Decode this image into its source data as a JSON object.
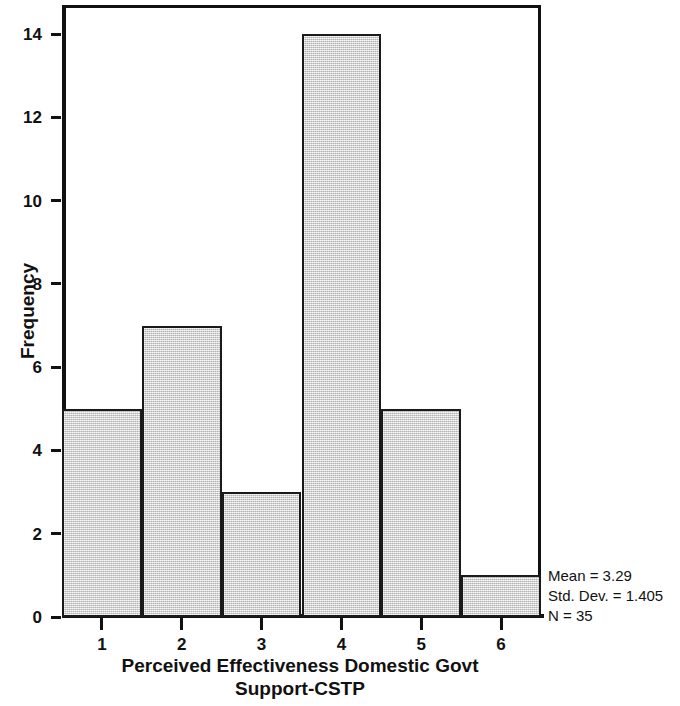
{
  "chart_data": {
    "type": "bar",
    "title": "",
    "xlabel": "Perceived Effectiveness Domestic Govt Support-CSTP",
    "xlabel_line1": "Perceived Effectiveness Domestic Govt",
    "xlabel_line2": "Support-CSTP",
    "ylabel": "Frequency",
    "categories": [
      "1",
      "2",
      "3",
      "4",
      "5",
      "6"
    ],
    "values": [
      5,
      7,
      3,
      14,
      5,
      1
    ],
    "bin_edges": [
      0.5,
      1.5,
      2.5,
      3.5,
      4.5,
      5.5,
      6.5
    ],
    "x_tick_labels": [
      "1",
      "2",
      "3",
      "4",
      "5",
      "6"
    ],
    "y_tick_labels": [
      "0",
      "2",
      "4",
      "6",
      "8",
      "10",
      "12",
      "14"
    ],
    "y_tick_values": [
      0,
      2,
      4,
      6,
      8,
      10,
      12,
      14
    ],
    "ylim": [
      0,
      14.7
    ],
    "xlim": [
      0.5,
      6.5
    ],
    "grid": false,
    "legend": false,
    "bar_fill_color": "#d9d9d9",
    "bar_edge_color": "#1a1a1a",
    "background_color": "#ffffff",
    "annotations": {
      "mean_label": "Mean = 3.29",
      "std_dev_label": "Std. Dev. = 1.405",
      "n_label": "N = 35",
      "mean_value": 3.29,
      "std_dev_value": 1.405,
      "n_value": 35,
      "position": "right-bottom"
    }
  }
}
